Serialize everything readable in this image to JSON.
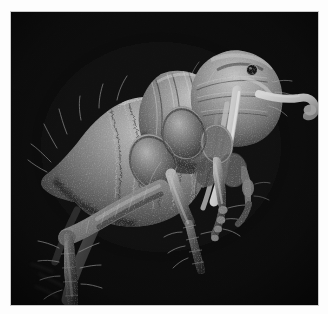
{
  "image": {
    "kind": "sem-micrograph",
    "subject": "flea",
    "view": "left lateral",
    "background_color": "#030303",
    "border_color": "#fdfdfd",
    "plate": {
      "x": 11,
      "y": 12,
      "width": 307,
      "height": 293
    },
    "palette": {
      "black": "#030303",
      "deep_shadow": "#0d0d0d",
      "dark_grey": "#2a2a2a",
      "mid_grey": "#6d6d6d",
      "light_grey": "#a8a8a8",
      "highlight": "#d8d8d8",
      "specular": "#f0f0f0"
    },
    "anatomy": [
      {
        "name": "abdomen",
        "label": "Abdomen"
      },
      {
        "name": "thorax",
        "label": "Thorax"
      },
      {
        "name": "head",
        "label": "Head"
      },
      {
        "name": "eye",
        "label": "Eye"
      },
      {
        "name": "antenna",
        "label": "Antenna"
      },
      {
        "name": "maxillary-palp",
        "label": "Maxillary palp"
      },
      {
        "name": "proboscis",
        "label": "Proboscis"
      },
      {
        "name": "foreleg",
        "label": "Foreleg"
      },
      {
        "name": "midleg",
        "label": "Midleg"
      },
      {
        "name": "hindleg",
        "label": "Hindleg"
      },
      {
        "name": "coxa",
        "label": "Coxa"
      },
      {
        "name": "femur",
        "label": "Femur"
      },
      {
        "name": "tibia",
        "label": "Tibia"
      },
      {
        "name": "tarsus",
        "label": "Tarsus"
      },
      {
        "name": "bristles",
        "label": "Bristles"
      }
    ],
    "scale_bar": null,
    "overlay_text": null
  }
}
